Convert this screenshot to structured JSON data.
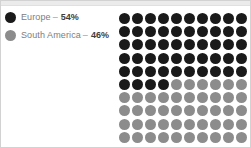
{
  "colors": {
    "primary": "#1a1a1a",
    "secondary": "#8c8c8c",
    "label_text": "#7d7d7d",
    "value_text": "#3d3d3d",
    "border": "#d2d2d2",
    "top_strip": "#ebebeb",
    "background": "#ffffff"
  },
  "legend": {
    "items": [
      {
        "label": "Europe",
        "separator": "–",
        "value": "54%",
        "color": "#1a1a1a"
      },
      {
        "label": "South America",
        "separator": "–",
        "value": "46%",
        "color": "#8c8c8c"
      }
    ]
  },
  "chart_data": {
    "type": "pie",
    "title": "",
    "subtitle": "",
    "xlabel": "",
    "ylabel": "",
    "display": "waffle-grid",
    "grid": {
      "rows": 10,
      "columns": 10,
      "total_cells": 100,
      "fill_order": "row-major"
    },
    "legend_position": "left",
    "categories": [
      "Europe",
      "South America"
    ],
    "values": [
      54,
      46
    ],
    "unit": "%",
    "series": [
      {
        "name": "Europe",
        "value": 54,
        "cells": 54,
        "color": "#1a1a1a"
      },
      {
        "name": "South America",
        "value": 46,
        "cells": 46,
        "color": "#8c8c8c"
      }
    ],
    "annotations": []
  }
}
